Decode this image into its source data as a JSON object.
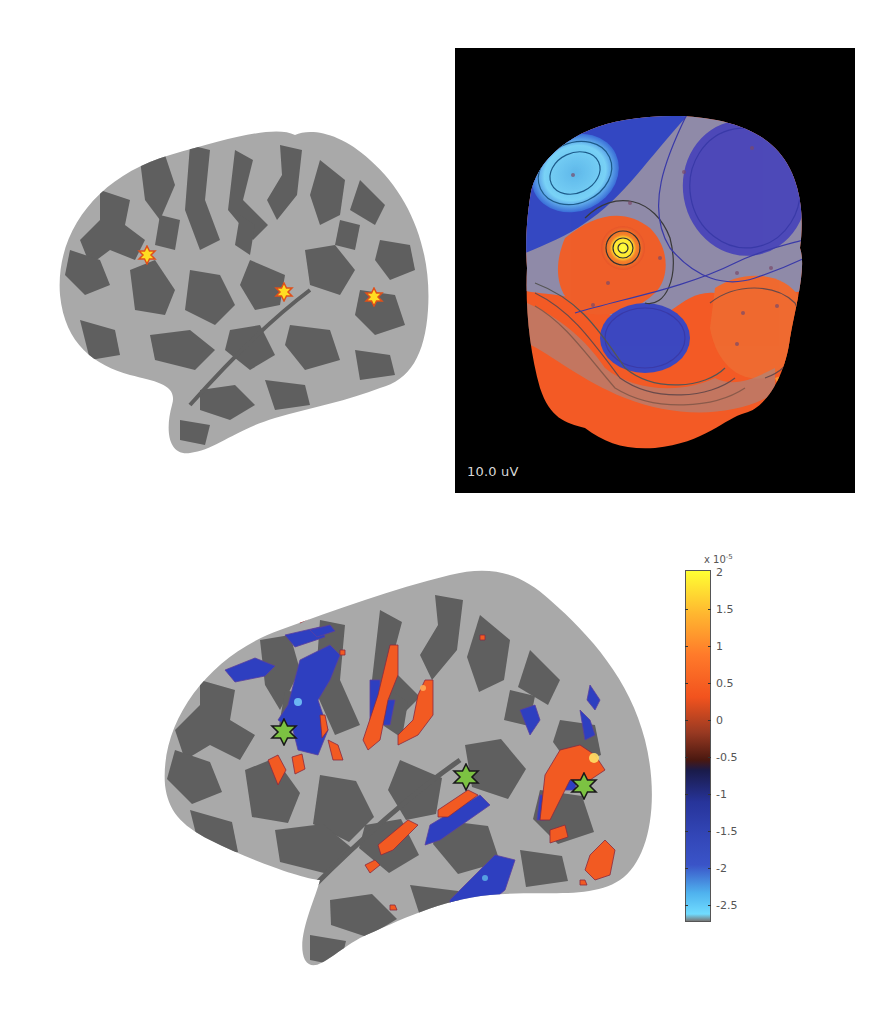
{
  "figure": {
    "panels": [
      {
        "id": "top-left",
        "description": "Inflated cortical surface with three dipole source markers"
      },
      {
        "id": "top-right",
        "description": "EEG scalp topography with contour lines"
      },
      {
        "id": "bottom",
        "description": "Inflated cortical surface with source activation map and green star markers"
      }
    ]
  },
  "topography": {
    "scale_label": "10.0 uV",
    "background": "#000000"
  },
  "colorbar": {
    "exponent_base": "x 10",
    "exponent_power": "-5",
    "ticks": [
      "2",
      "1.5",
      "1",
      "0.5",
      "0",
      "-0.5",
      "-1",
      "-1.5",
      "-2",
      "-2.5"
    ],
    "max": 2,
    "min": -2.7,
    "colors": {
      "max": "#ffff33",
      "high": "#ff7a2a",
      "zero": "#1a1b4a",
      "low": "#3347b8",
      "min": "#70dcff"
    }
  },
  "markers": {
    "top_brain": [
      {
        "type": "orange-star",
        "x": 147,
        "y": 255
      },
      {
        "type": "orange-star",
        "x": 284,
        "y": 292
      },
      {
        "type": "orange-star",
        "x": 374,
        "y": 297
      }
    ],
    "bottom_brain": [
      {
        "type": "green-star",
        "x": 284,
        "y": 732
      },
      {
        "type": "green-star",
        "x": 466,
        "y": 777
      },
      {
        "type": "green-star",
        "x": 584,
        "y": 786
      }
    ]
  },
  "colors": {
    "gyri": "#a9a9a9",
    "sulci": "#5f5f5f",
    "activation_positive": "#f25a22",
    "activation_negative": "#2e3fc0",
    "marker_green": "#7cc242",
    "marker_orange": "#ffcc22"
  }
}
